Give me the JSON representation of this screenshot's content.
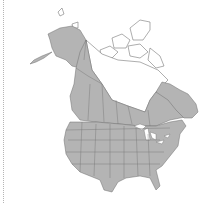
{
  "map": {
    "title": "North America range map",
    "region": "North America",
    "legend": [],
    "colors": {
      "present": "#b4b4b4",
      "absent": "#ffffff",
      "border": "#6e6e6e",
      "coast": "#777777",
      "dotted_line": "#b5b5b5"
    },
    "shaded_regions": [
      "Alaska",
      "Western and southern Canada",
      "Contiguous United States",
      "Eastern Canada / Labrador"
    ],
    "unshaded_regions": [
      "Canadian Arctic Archipelago",
      "Northern Canada",
      "Great Lakes",
      "Hudson Bay area"
    ]
  }
}
